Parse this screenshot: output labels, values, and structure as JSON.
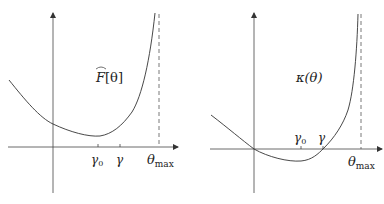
{
  "figure": {
    "panels": [
      {
        "id": "left",
        "function_label": "F̂[θ]",
        "function_label_base": "F",
        "function_label_arg": "[θ]",
        "ticks": [
          {
            "label_base": "γ",
            "label_sub": "0",
            "x": 98
          },
          {
            "label_base": "γ",
            "label_sub": "",
            "x": 120
          }
        ],
        "asymptote_label_base": "θ",
        "asymptote_label_sub": "max"
      },
      {
        "id": "right",
        "function_label": "κ(θ)",
        "ticks": [
          {
            "label_base": "γ",
            "label_sub": "0",
            "x": 301
          },
          {
            "label_base": "γ",
            "label_sub": "",
            "x": 323
          }
        ],
        "asymptote_label_base": "θ",
        "asymptote_label_sub": "max"
      }
    ],
    "colors": {
      "axis": "#333333",
      "curve": "#333333",
      "dashed": "#555555",
      "background": "#ffffff"
    }
  }
}
